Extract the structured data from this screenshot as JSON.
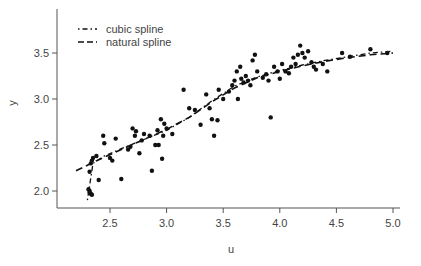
{
  "chart_data": {
    "type": "scatter",
    "title": "",
    "xlabel": "u",
    "ylabel": "y",
    "xlim": [
      2.2,
      5.1
    ],
    "ylim": [
      1.85,
      3.95
    ],
    "xticks": [
      2.5,
      3.0,
      3.5,
      4.0,
      4.5,
      5.0
    ],
    "xtick_labels": [
      "2.5",
      "3.0",
      "3.5",
      "4.0",
      "4.5",
      "5.0"
    ],
    "yticks": [
      2.0,
      2.5,
      3.0,
      3.5
    ],
    "ytick_labels": [
      "2.0",
      "2.5",
      "3.0",
      "3.5"
    ],
    "grid": false,
    "legend": {
      "position": "top-left",
      "entries": [
        {
          "label": "cubic spline",
          "style": "dash-dot"
        },
        {
          "label": "natural spline",
          "style": "dashed"
        }
      ]
    },
    "points": [
      [
        2.32,
        1.98
      ],
      [
        2.33,
        1.97
      ],
      [
        2.34,
        1.96
      ],
      [
        2.32,
        2.0
      ],
      [
        2.31,
        2.02
      ],
      [
        2.32,
        2.21
      ],
      [
        2.33,
        2.3
      ],
      [
        2.34,
        2.33
      ],
      [
        2.35,
        2.36
      ],
      [
        2.38,
        2.38
      ],
      [
        2.4,
        2.12
      ],
      [
        2.44,
        2.6
      ],
      [
        2.45,
        2.52
      ],
      [
        2.5,
        2.36
      ],
      [
        2.52,
        2.33
      ],
      [
        2.55,
        2.57
      ],
      [
        2.6,
        2.13
      ],
      [
        2.66,
        2.45
      ],
      [
        2.68,
        2.48
      ],
      [
        2.7,
        2.68
      ],
      [
        2.72,
        2.6
      ],
      [
        2.73,
        2.65
      ],
      [
        2.76,
        2.41
      ],
      [
        2.78,
        2.55
      ],
      [
        2.8,
        2.62
      ],
      [
        2.85,
        2.6
      ],
      [
        2.87,
        2.22
      ],
      [
        2.9,
        2.5
      ],
      [
        2.92,
        2.66
      ],
      [
        2.93,
        2.5
      ],
      [
        2.95,
        2.78
      ],
      [
        2.96,
        2.35
      ],
      [
        2.97,
        2.6
      ],
      [
        2.98,
        2.73
      ],
      [
        3.0,
        2.68
      ],
      [
        3.05,
        2.62
      ],
      [
        3.15,
        3.1
      ],
      [
        3.2,
        2.9
      ],
      [
        3.25,
        2.88
      ],
      [
        3.3,
        2.72
      ],
      [
        3.35,
        3.05
      ],
      [
        3.38,
        2.9
      ],
      [
        3.4,
        2.78
      ],
      [
        3.42,
        2.6
      ],
      [
        3.45,
        2.77
      ],
      [
        3.46,
        3.1
      ],
      [
        3.5,
        3.0
      ],
      [
        3.55,
        3.08
      ],
      [
        3.58,
        3.15
      ],
      [
        3.6,
        3.2
      ],
      [
        3.62,
        3.3
      ],
      [
        3.63,
        3.0
      ],
      [
        3.65,
        3.35
      ],
      [
        3.66,
        3.22
      ],
      [
        3.68,
        3.18
      ],
      [
        3.7,
        3.25
      ],
      [
        3.72,
        3.2
      ],
      [
        3.74,
        3.15
      ],
      [
        3.76,
        3.42
      ],
      [
        3.78,
        3.48
      ],
      [
        3.8,
        3.3
      ],
      [
        3.85,
        3.23
      ],
      [
        3.88,
        3.27
      ],
      [
        3.9,
        3.2
      ],
      [
        3.92,
        2.8
      ],
      [
        3.95,
        3.35
      ],
      [
        3.98,
        3.3
      ],
      [
        4.0,
        3.22
      ],
      [
        4.02,
        3.38
      ],
      [
        4.05,
        3.3
      ],
      [
        4.08,
        3.28
      ],
      [
        4.1,
        3.35
      ],
      [
        4.12,
        3.45
      ],
      [
        4.14,
        3.38
      ],
      [
        4.16,
        3.48
      ],
      [
        4.18,
        3.58
      ],
      [
        4.2,
        3.5
      ],
      [
        4.22,
        3.45
      ],
      [
        4.25,
        3.52
      ],
      [
        4.28,
        3.4
      ],
      [
        4.3,
        3.35
      ],
      [
        4.32,
        3.32
      ],
      [
        4.38,
        3.38
      ],
      [
        4.42,
        3.3
      ],
      [
        4.55,
        3.5
      ],
      [
        4.62,
        3.46
      ],
      [
        4.8,
        3.54
      ],
      [
        4.95,
        3.5
      ]
    ],
    "series": [
      {
        "name": "cubic spline",
        "style": "dash-dot",
        "x": [
          2.3,
          2.35,
          2.45,
          2.6,
          2.8,
          3.0,
          3.2,
          3.4,
          3.6,
          3.8,
          4.0,
          4.2,
          4.4,
          4.6,
          4.8,
          5.0
        ],
        "y": [
          1.9,
          2.3,
          2.38,
          2.46,
          2.56,
          2.66,
          2.8,
          2.98,
          3.14,
          3.24,
          3.31,
          3.37,
          3.42,
          3.46,
          3.5,
          3.52
        ]
      },
      {
        "name": "natural spline",
        "style": "dashed",
        "x": [
          2.2,
          2.4,
          2.6,
          2.8,
          3.0,
          3.2,
          3.4,
          3.6,
          3.8,
          4.0,
          4.2,
          4.4,
          4.6,
          4.8,
          5.0
        ],
        "y": [
          2.22,
          2.34,
          2.45,
          2.56,
          2.67,
          2.8,
          2.97,
          3.12,
          3.23,
          3.3,
          3.36,
          3.41,
          3.45,
          3.48,
          3.5
        ]
      }
    ]
  },
  "colors": {
    "axis": "#555555",
    "points": "#111111",
    "lines": "#111111",
    "text": "#444444"
  }
}
